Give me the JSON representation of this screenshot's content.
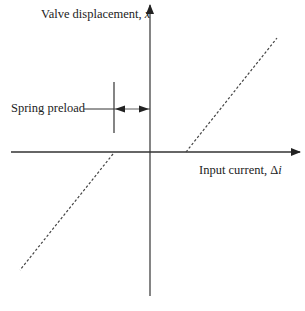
{
  "diagram": {
    "y_axis_label": "Valve displacement, ",
    "y_axis_var": "x",
    "x_axis_label": "Input current, Δ",
    "x_axis_var": "i",
    "annotation": "Spring preload",
    "colors": {
      "line": "#333333",
      "dash": "#444444",
      "background": "#ffffff"
    }
  }
}
